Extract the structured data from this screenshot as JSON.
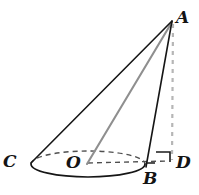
{
  "figure": {
    "kind": "geometry-diagram",
    "background_color": "#ffffff",
    "stroke_color": "#1a1a1a",
    "axis_color": "#8c8c8c",
    "dashed_color": "#5a5a5a",
    "height_dash_color": "#b3b3b3",
    "labels": {
      "apex": "A",
      "base_left": "C",
      "base_center": "O",
      "base_right": "B",
      "foot": "D"
    },
    "points": {
      "A": {
        "x": 173,
        "y": 21
      },
      "C": {
        "x": 31,
        "y": 163
      },
      "O": {
        "x": 87,
        "y": 163
      },
      "B": {
        "x": 146,
        "y": 166
      },
      "D": {
        "x": 172,
        "y": 161
      }
    },
    "base_ellipse": {
      "center_x": 88,
      "center_y": 164,
      "radius_x": 57,
      "radius_y": 13,
      "front_arc_style": "solid",
      "back_arc_style": "dashed"
    },
    "segments": [
      {
        "name": "slant-AC",
        "from": "A",
        "to": "C",
        "style": "solid",
        "color": "#1a1a1a"
      },
      {
        "name": "slant-AB",
        "from": "A",
        "to": "B",
        "style": "solid",
        "color": "#1a1a1a"
      },
      {
        "name": "axis-AO",
        "from": "A",
        "to": "O",
        "style": "solid",
        "color": "#8c8c8c"
      },
      {
        "name": "radius-OD",
        "from": "O",
        "to": "D",
        "style": "dashed",
        "color": "#5a5a5a"
      },
      {
        "name": "height-AD",
        "from": "A",
        "to": "D",
        "style": "dashed",
        "color": "#b3b3b3"
      }
    ],
    "right_angle_marker": {
      "at": "D",
      "description": "square angle marker between segment BD and segment AD"
    }
  }
}
